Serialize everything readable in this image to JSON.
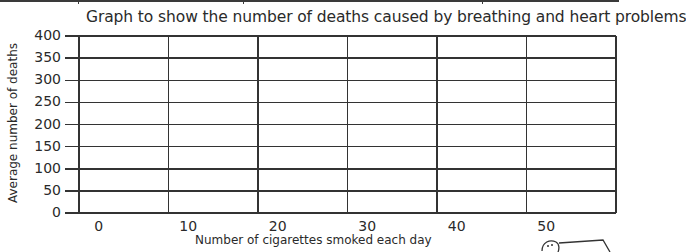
{
  "chart_data": {
    "type": "table",
    "title": "Graph to show the number of deaths caused by breathing and heart problems",
    "xlabel": "Number of cigarettes smoked each day",
    "ylabel": "Average number of deaths",
    "x_tick_labels": [
      "0",
      "10",
      "20",
      "30",
      "40",
      "50"
    ],
    "y_tick_labels": [
      "400",
      "350",
      "300",
      "250",
      "200",
      "150",
      "100",
      "50",
      "0"
    ],
    "ylim": [
      0,
      400
    ],
    "y_step": 50,
    "grid": true,
    "series": [],
    "note": "Empty bar-chart grid template; no data plotted"
  },
  "colors": {
    "line": "#333333",
    "text": "#2a2a2a",
    "background": "#ffffff"
  }
}
